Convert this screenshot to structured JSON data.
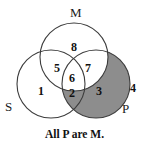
{
  "figure": {
    "caption": "All P are M.",
    "shade_color": "#8d8d8d",
    "outline_color": "#3c3c3c",
    "background_color": "#ffffff"
  },
  "set_labels": {
    "m": "M",
    "s": "S",
    "p": "P"
  },
  "regions": [
    {
      "id": "m-only",
      "number": "8",
      "x": 74,
      "y": 47,
      "shaded": false
    },
    {
      "id": "s-and-m",
      "number": "5",
      "x": 57,
      "y": 68,
      "shaded": false
    },
    {
      "id": "m-and-p",
      "number": "7",
      "x": 88,
      "y": 68,
      "shaded": false
    },
    {
      "id": "s-m-and-p",
      "number": "6",
      "x": 72,
      "y": 78,
      "shaded": false
    },
    {
      "id": "s-only",
      "number": "1",
      "x": 41,
      "y": 91,
      "shaded": false
    },
    {
      "id": "s-and-p",
      "number": "2",
      "x": 72,
      "y": 93,
      "shaded": true
    },
    {
      "id": "p-only",
      "number": "3",
      "x": 99,
      "y": 91,
      "shaded": true
    },
    {
      "id": "outside-all",
      "number": "4",
      "x": 133,
      "y": 88,
      "shaded": false
    }
  ],
  "geometry": {
    "m_circle": {
      "cx": 74,
      "cy": 57,
      "r": 34
    },
    "s_circle": {
      "cx": 51,
      "cy": 84,
      "r": 34
    },
    "p_circle": {
      "cx": 96,
      "cy": 84,
      "r": 34
    }
  }
}
